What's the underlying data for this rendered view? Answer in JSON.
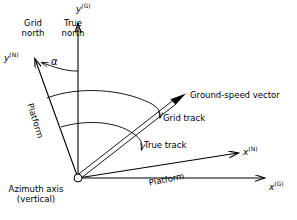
{
  "figure": {
    "type": "technical-vector-diagram",
    "background_color": "#ffffff",
    "line_color": "#000000"
  },
  "labels": {
    "grid_north": "Grid\nnorth",
    "grid_north_line1": "Grid",
    "grid_north_line2": "north",
    "true_north_line1": "True",
    "true_north_line2": "north",
    "alpha": "α",
    "platform_left": "Platform",
    "platform_right": "Platform",
    "ground_speed_vector": "Ground-speed vector",
    "grid_track": "Grid track",
    "true_track": "True track",
    "azimuth_axis_line1": "Azimuth axis",
    "azimuth_axis_line2": "(vertical)"
  },
  "axes": [
    {
      "name": "y-grid",
      "symbol": "y",
      "superscript": "(G)",
      "direction": "up",
      "origin": [
        78,
        178
      ],
      "tip": [
        78,
        22
      ]
    },
    {
      "name": "y-nav",
      "symbol": "y",
      "superscript": "(N)",
      "direction": "up-left",
      "origin": [
        78,
        178
      ],
      "tip": [
        34,
        57
      ]
    },
    {
      "name": "x-nav",
      "symbol": "x",
      "superscript": "(N)",
      "direction": "right-up",
      "origin": [
        78,
        178
      ],
      "tip": [
        240,
        152
      ]
    },
    {
      "name": "x-grid",
      "symbol": "x",
      "superscript": "(G)",
      "direction": "right",
      "origin": [
        78,
        178
      ],
      "tip": [
        266,
        178
      ]
    }
  ],
  "axis_labels": [
    {
      "symbol": "y",
      "superscript": "(G)"
    },
    {
      "symbol": "y",
      "superscript": "(N)"
    },
    {
      "symbol": "x",
      "superscript": "(N)"
    },
    {
      "symbol": "x",
      "superscript": "(G)"
    }
  ],
  "vector": {
    "name": "ground-speed-vector",
    "origin": [
      78,
      178
    ],
    "tip": [
      186,
      94
    ],
    "style": "double-line-with-solid-arrowhead"
  },
  "angles": [
    {
      "name": "alpha",
      "label": "α",
      "between": [
        "y-grid",
        "y-nav"
      ],
      "vertex": [
        78,
        178
      ]
    },
    {
      "name": "grid-track",
      "label": "Grid track",
      "from": "y-nav",
      "to": "ground-speed-vector",
      "vertex": [
        78,
        178
      ]
    },
    {
      "name": "true-track",
      "label": "True track",
      "from": "y-grid",
      "to": "ground-speed-vector",
      "vertex": [
        78,
        178
      ]
    }
  ],
  "origin_marker": {
    "name": "azimuth-axis-origin",
    "shape": "small-open-circle",
    "position": [
      78,
      178
    ],
    "radius": 4
  }
}
